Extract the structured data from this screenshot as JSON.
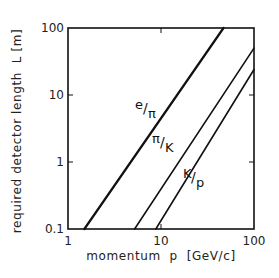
{
  "chart_data": {
    "type": "line",
    "title": "",
    "xlabel": "momentum  p  [GeV/c]",
    "ylabel": "required detector length  L [m]",
    "xscale": "log",
    "yscale": "log",
    "xlim": [
      1,
      100
    ],
    "ylim": [
      0.1,
      100
    ],
    "xticks": [
      "1",
      "10",
      "100"
    ],
    "yticks": [
      "0.1",
      "1",
      "10",
      "100"
    ],
    "grid": false,
    "legend": "inline labels",
    "series": [
      {
        "name": "e/π",
        "label_num": "e",
        "label_den": "π",
        "x": [
          1.5,
          47
        ],
        "y": [
          0.1,
          100
        ]
      },
      {
        "name": "π/K",
        "label_num": "π",
        "label_den": "K",
        "x": [
          5.2,
          100
        ],
        "y": [
          0.1,
          50
        ]
      },
      {
        "name": "K/p",
        "label_num": "K",
        "label_den": "p",
        "x": [
          8.8,
          100
        ],
        "y": [
          0.1,
          24
        ]
      }
    ]
  }
}
